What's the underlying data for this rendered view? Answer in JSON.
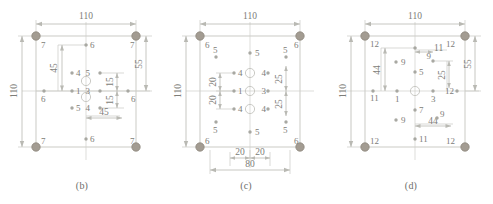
{
  "figure": {
    "colors": {
      "line": "#b9b9b3",
      "thin_line": "#c9c9c4",
      "text": "#7d7d78",
      "corner_marker": "#a39c92",
      "corner_marker_edge": "#8d867c",
      "small_marker": "#a8a8a2",
      "open_circle": "#bdbdb7",
      "background": "#ffffff"
    },
    "panels": [
      {
        "id": "b",
        "caption": "(b)",
        "plate": {
          "width": "110",
          "height": "110"
        },
        "dimensions": [
          {
            "name": "top-width",
            "value": "110",
            "orientation": "horizontal"
          },
          {
            "name": "left-height",
            "value": "110",
            "orientation": "vertical"
          },
          {
            "name": "right-offset",
            "value": "55",
            "orientation": "vertical"
          },
          {
            "name": "inner-vertical",
            "value": "45",
            "orientation": "vertical"
          },
          {
            "name": "inner-horizontal",
            "value": "45",
            "orientation": "horizontal"
          },
          {
            "name": "stack-upper",
            "value": "15",
            "orientation": "vertical"
          },
          {
            "name": "stack-lower",
            "value": "15",
            "orientation": "vertical"
          }
        ],
        "point_labels": [
          {
            "id": "tl",
            "text": "7"
          },
          {
            "id": "tc",
            "text": "6"
          },
          {
            "id": "tr",
            "text": "7"
          },
          {
            "id": "ml-out",
            "text": "6"
          },
          {
            "id": "mr-out",
            "text": "6"
          },
          {
            "id": "bl",
            "text": "7"
          },
          {
            "id": "bc",
            "text": "6"
          },
          {
            "id": "br",
            "text": "7"
          },
          {
            "id": "c-left-up",
            "text": "4"
          },
          {
            "id": "c-left-mid",
            "text": "1"
          },
          {
            "id": "c-left-dn",
            "text": "5"
          },
          {
            "id": "c-right-up",
            "text": "5"
          },
          {
            "id": "c-right-mid",
            "text": "3"
          },
          {
            "id": "c-right-dn",
            "text": "4"
          }
        ]
      },
      {
        "id": "c",
        "caption": "(c)",
        "plate": {
          "width": "110",
          "height": "110"
        },
        "dimensions": [
          {
            "name": "top-width",
            "value": "110",
            "orientation": "horizontal"
          },
          {
            "name": "left-height",
            "value": "110",
            "orientation": "vertical"
          },
          {
            "name": "inner-upper",
            "value": "20",
            "orientation": "vertical"
          },
          {
            "name": "inner-lower",
            "value": "20",
            "orientation": "vertical"
          },
          {
            "name": "right-upper",
            "value": "25",
            "orientation": "vertical"
          },
          {
            "name": "right-lower",
            "value": "25",
            "orientation": "vertical"
          },
          {
            "name": "bottom-left-span",
            "value": "20",
            "orientation": "horizontal"
          },
          {
            "name": "bottom-right-span",
            "value": "20",
            "orientation": "horizontal"
          },
          {
            "name": "bottom-total",
            "value": "80",
            "orientation": "horizontal"
          }
        ],
        "point_labels": [
          {
            "id": "tl",
            "text": "6"
          },
          {
            "id": "tr",
            "text": "6"
          },
          {
            "id": "bl",
            "text": "6"
          },
          {
            "id": "br",
            "text": "6"
          },
          {
            "id": "top-center",
            "text": "5"
          },
          {
            "id": "bottom-center",
            "text": "5"
          },
          {
            "id": "left-up",
            "text": "5"
          },
          {
            "id": "left-dn",
            "text": "5"
          },
          {
            "id": "right-up",
            "text": "5"
          },
          {
            "id": "right-dn",
            "text": "5"
          },
          {
            "id": "ci-lu",
            "text": "4"
          },
          {
            "id": "ci-lm",
            "text": "1"
          },
          {
            "id": "ci-ld",
            "text": "4"
          },
          {
            "id": "ci-ru",
            "text": "4"
          },
          {
            "id": "ci-rm",
            "text": "3"
          },
          {
            "id": "ci-rd",
            "text": "4"
          }
        ]
      },
      {
        "id": "d",
        "caption": "(d)",
        "plate": {
          "width": "110",
          "height": "110"
        },
        "dimensions": [
          {
            "name": "top-width",
            "value": "110",
            "orientation": "horizontal"
          },
          {
            "name": "left-height",
            "value": "110",
            "orientation": "vertical"
          },
          {
            "name": "right-offset",
            "value": "55",
            "orientation": "vertical"
          },
          {
            "name": "inner-left-vertical",
            "value": "44",
            "orientation": "vertical"
          },
          {
            "name": "inner-top-horizontal",
            "value": "11",
            "orientation": "horizontal"
          },
          {
            "name": "inner-right-vertical",
            "value": "25",
            "orientation": "vertical"
          },
          {
            "name": "inner-bottom-horizontal",
            "value": "44",
            "orientation": "horizontal"
          }
        ],
        "point_labels": [
          {
            "id": "tl",
            "text": "12"
          },
          {
            "id": "tr",
            "text": "12"
          },
          {
            "id": "bl",
            "text": "12"
          },
          {
            "id": "br",
            "text": "12"
          },
          {
            "id": "top-center",
            "text": "11"
          },
          {
            "id": "bottom-center",
            "text": "11"
          },
          {
            "id": "left-center",
            "text": "11"
          },
          {
            "id": "right-center",
            "text": "11"
          },
          {
            "id": "q-tl",
            "text": "9"
          },
          {
            "id": "q-tr",
            "text": "9"
          },
          {
            "id": "q-bl",
            "text": "9"
          },
          {
            "id": "q-br",
            "text": "9"
          },
          {
            "id": "c-up",
            "text": "5"
          },
          {
            "id": "c-dn",
            "text": "7"
          },
          {
            "id": "c-left",
            "text": "1"
          },
          {
            "id": "c-right",
            "text": "3"
          }
        ]
      }
    ]
  }
}
